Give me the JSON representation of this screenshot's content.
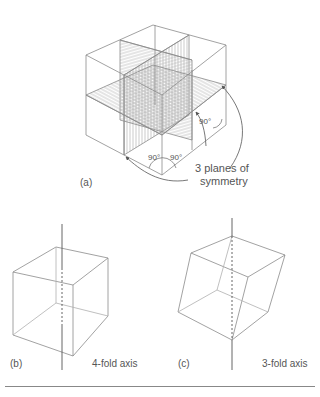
{
  "figure_a": {
    "label": "(a)",
    "annotation_line1": "3 planes of",
    "annotation_line2": "symmetry",
    "angle_labels": [
      "90°",
      "90°",
      "90°"
    ]
  },
  "figure_b": {
    "label": "(b)",
    "caption": "4-fold axis"
  },
  "figure_c": {
    "label": "(c)",
    "caption": "3-fold axis"
  },
  "colors": {
    "line": "#8a8a8a",
    "hatch": "#a0a0a0",
    "text": "#555555"
  }
}
